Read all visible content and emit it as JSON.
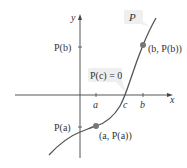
{
  "figure": {
    "axes": {
      "x_label": "x",
      "y_label": "y"
    },
    "x_ticks": [
      {
        "label": "a",
        "x": 96
      },
      {
        "label": "c",
        "x": 125
      },
      {
        "label": "b",
        "x": 143
      }
    ],
    "y_ticks": [
      {
        "label": "P(b)",
        "y": 47
      },
      {
        "label": "P(a)",
        "y": 127
      }
    ],
    "curve_label": "P",
    "root_label": "P(c) = 0",
    "points": [
      {
        "label": "(b, P(b))",
        "x": 143,
        "y": 45
      },
      {
        "label": "(a, P(a))",
        "x": 96,
        "y": 126
      }
    ],
    "colors": {
      "axis": "#444444",
      "curve": "#555555",
      "point": "#777777",
      "callout_bg": "#efefef",
      "text": "#333333"
    }
  }
}
